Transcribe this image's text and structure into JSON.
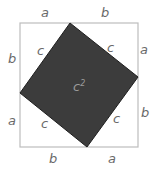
{
  "diagram": {
    "outer_square": {
      "x": 20,
      "y": 23,
      "size": 118,
      "stroke": "#bdbdbd"
    },
    "inner_square": {
      "points": [
        [
          70,
          23
        ],
        [
          138,
          77
        ],
        [
          87,
          147
        ],
        [
          20,
          93
        ]
      ],
      "fill": "#3c3c3c",
      "stroke": "#1e1e1e",
      "label": "c",
      "label_sup": "2"
    },
    "labels": {
      "top_left": "a",
      "top_right": "b",
      "left_top": "b",
      "left_bottom": "a",
      "right_top": "a",
      "right_bottom": "b",
      "bottom_left": "b",
      "bottom_right": "a",
      "hyp_top_left": "c",
      "hyp_top_right": "c",
      "hyp_bottom_left": "c",
      "hyp_bottom_right": "c"
    }
  }
}
